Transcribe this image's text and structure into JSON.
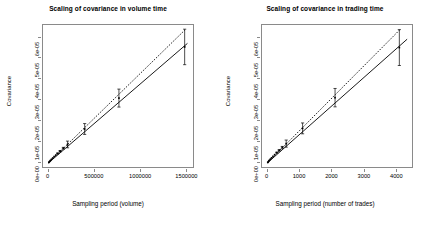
{
  "figure": {
    "width": 433,
    "height": 225,
    "background": "#ffffff",
    "line_color": "#000000",
    "axis_color": "#8a8a8a"
  },
  "chart_data": [
    {
      "type": "scatter",
      "id": "volume-time",
      "title": "Scaling of covariance in volume time",
      "xlabel": "Sampling period (volume)",
      "ylabel": "Covariance",
      "xlim": [
        -60000,
        1560000
      ],
      "ylim": [
        -2e-06,
        6.6e-05
      ],
      "xticks": [
        0,
        500000,
        1000000,
        1500000
      ],
      "xticklabels": [
        "0",
        "500000",
        "1000000",
        "1500000"
      ],
      "yticks": [
        0,
        1e-05,
        2e-05,
        3e-05,
        4e-05,
        5e-05,
        6e-05
      ],
      "yticklabels": [
        "0e+00",
        "1e-05",
        "2e-05",
        "3e-05",
        "4e-05",
        "5e-05",
        "6e-05"
      ],
      "grid": false,
      "legend": null,
      "points": [
        {
          "x": 3000,
          "y": 2e-07,
          "err": 0
        },
        {
          "x": 8000,
          "y": 5e-07,
          "err": 0
        },
        {
          "x": 14000,
          "y": 8e-07,
          "err": 0
        },
        {
          "x": 22000,
          "y": 1.2e-06,
          "err": 0
        },
        {
          "x": 32000,
          "y": 1.7e-06,
          "err": 0
        },
        {
          "x": 45000,
          "y": 2.3e-06,
          "err": 0
        },
        {
          "x": 60000,
          "y": 3e-06,
          "err": 0
        },
        {
          "x": 78000,
          "y": 3.7e-06,
          "err": 0
        },
        {
          "x": 98000,
          "y": 4.5e-06,
          "err": 2e-07
        },
        {
          "x": 125000,
          "y": 5.6e-06,
          "err": 3e-07
        },
        {
          "x": 160000,
          "y": 7e-06,
          "err": 4e-07
        },
        {
          "x": 205000,
          "y": 8.8e-06,
          "err": 1.6e-06
        },
        {
          "x": 390000,
          "y": 1.62e-05,
          "err": 2.6e-06
        },
        {
          "x": 760000,
          "y": 3.1e-05,
          "err": 4.3e-06
        },
        {
          "x": 1470000,
          "y": 5.55e-05,
          "err": 8.5e-06
        }
      ],
      "series": [
        {
          "name": "fitted",
          "style": "solid",
          "x": [
            0,
            1500000
          ],
          "y": [
            0.0,
            5.72e-05
          ]
        },
        {
          "name": "reference",
          "style": "dotted",
          "x": [
            0,
            1470000
          ],
          "y": [
            0.0,
            6.35e-05
          ]
        }
      ]
    },
    {
      "type": "scatter",
      "id": "trading-time",
      "title": "Scaling of covariance in trading time",
      "xlabel": "Sampling period (number of trades)",
      "ylabel": "Covariance",
      "xlim": [
        -170,
        4450
      ],
      "ylim": [
        -2e-06,
        6.6e-05
      ],
      "xticks": [
        0,
        1000,
        2000,
        3000,
        4000
      ],
      "xticklabels": [
        "0",
        "1000",
        "2000",
        "3000",
        "4000"
      ],
      "yticks": [
        0,
        1e-05,
        2e-05,
        3e-05,
        4e-05,
        5e-05,
        6e-05
      ],
      "yticklabels": [
        "0e+00",
        "1e-05",
        "2e-05",
        "3e-05",
        "4e-05",
        "5e-05",
        "6e-05"
      ],
      "grid": false,
      "legend": null,
      "points": [
        {
          "x": 8,
          "y": 2e-07,
          "err": 0
        },
        {
          "x": 22,
          "y": 5e-07,
          "err": 0
        },
        {
          "x": 40,
          "y": 9e-07,
          "err": 0
        },
        {
          "x": 62,
          "y": 1.3e-06,
          "err": 0
        },
        {
          "x": 90,
          "y": 1.8e-06,
          "err": 0
        },
        {
          "x": 125,
          "y": 2.4e-06,
          "err": 0
        },
        {
          "x": 168,
          "y": 3.1e-06,
          "err": 0
        },
        {
          "x": 220,
          "y": 3.9e-06,
          "err": 0
        },
        {
          "x": 285,
          "y": 4.9e-06,
          "err": 2e-07
        },
        {
          "x": 360,
          "y": 6e-06,
          "err": 3e-07
        },
        {
          "x": 455,
          "y": 7.4e-06,
          "err": 4.5e-07
        },
        {
          "x": 575,
          "y": 9.2e-06,
          "err": 1.7e-06
        },
        {
          "x": 1080,
          "y": 1.65e-05,
          "err": 2.6e-06
        },
        {
          "x": 2080,
          "y": 3.12e-05,
          "err": 4.4e-06
        },
        {
          "x": 4060,
          "y": 5.52e-05,
          "err": 8.6e-06
        }
      ],
      "series": [
        {
          "name": "fitted",
          "style": "solid",
          "x": [
            0,
            4300
          ],
          "y": [
            0.0,
            5.92e-05
          ]
        },
        {
          "name": "reference",
          "style": "dotted",
          "x": [
            0,
            4060
          ],
          "y": [
            0.0,
            6.35e-05
          ]
        }
      ]
    }
  ]
}
